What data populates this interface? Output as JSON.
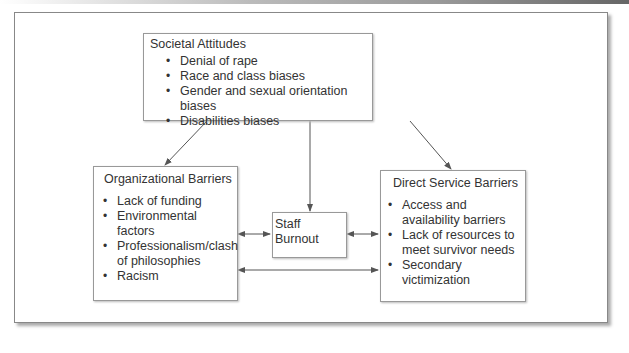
{
  "diagram": {
    "nodes": {
      "societal_attitudes": {
        "title": "Societal Attitudes",
        "items": [
          "Denial of rape",
          "Race and class biases",
          "Gender and sexual orientation biases",
          "Disabilities biases"
        ]
      },
      "organizational_barriers": {
        "title": "Organizational Barriers",
        "items": [
          "Lack of funding",
          "Environmental factors",
          "Professionalism/clash of philosophies",
          "Racism"
        ]
      },
      "staff_burnout": {
        "title": "Staff Burnout"
      },
      "direct_service_barriers": {
        "title": "Direct Service Barriers",
        "items": [
          "Access and availability barriers",
          "Lack of resources to meet survivor needs",
          "Secondary victimization"
        ]
      }
    },
    "edges": [
      {
        "from": "Societal Attitudes",
        "to": "Organizational Barriers",
        "direction": "one-way"
      },
      {
        "from": "Societal Attitudes",
        "to": "Staff Burnout",
        "direction": "one-way"
      },
      {
        "from": "Societal Attitudes",
        "to": "Direct Service Barriers",
        "direction": "one-way"
      },
      {
        "from": "Organizational Barriers",
        "to": "Staff Burnout",
        "direction": "two-way"
      },
      {
        "from": "Staff Burnout",
        "to": "Direct Service Barriers",
        "direction": "two-way"
      },
      {
        "from": "Organizational Barriers",
        "to": "Direct Service Barriers",
        "direction": "two-way"
      }
    ],
    "colors": {
      "line": "#555555",
      "border": "#999999",
      "text": "#333333"
    }
  }
}
